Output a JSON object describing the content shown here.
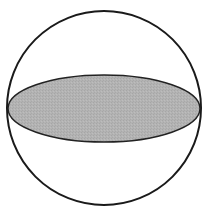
{
  "diagram": {
    "type": "sphere-with-great-circle",
    "canvas": {
      "width": 222,
      "height": 209
    },
    "sphere": {
      "cx": 104,
      "cy": 108,
      "r": 97,
      "stroke": "#1a1a1a",
      "stroke_width": 2,
      "fill": "#ffffff"
    },
    "equatorial_disc": {
      "cx": 104,
      "cy": 108.5,
      "rx": 96,
      "ry": 33.5,
      "stroke": "#222222",
      "stroke_width": 1.5,
      "fill": "#b0b0b0"
    }
  }
}
